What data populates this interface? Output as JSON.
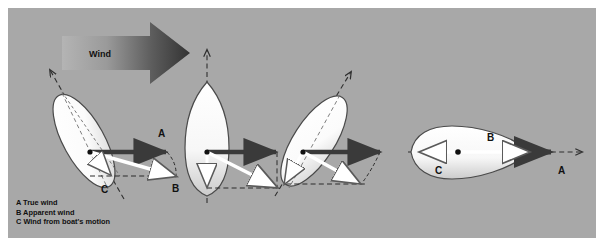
{
  "figure": {
    "background_color": "#a8a8a8",
    "page_color": "#ffffff",
    "panel": {
      "x": 8,
      "y": 8,
      "width": 588,
      "height": 230
    }
  },
  "wind": {
    "label": "Wind",
    "direction": "left-to-right",
    "arrow_gradient_from": "#b9b9b9",
    "arrow_gradient_to": "#3c3c3c",
    "label_x": 100,
    "label_y": 62
  },
  "legend": {
    "items": [
      {
        "key": "A",
        "text": "A True wind"
      },
      {
        "key": "B",
        "text": "B Apparent wind"
      },
      {
        "key": "C",
        "text": "C Wind from boat's motion"
      }
    ],
    "x": 16,
    "y_start": 203,
    "line_height": 9.5
  },
  "vectors": {
    "true_wind": {
      "key": "A",
      "name": "True wind",
      "color": "#3a3a3a",
      "style": "solid-dark-arrow"
    },
    "apparent_wind": {
      "key": "B",
      "name": "Apparent wind",
      "color": "#ffffff",
      "style": "solid-white-arrow"
    },
    "boat_motion_wind": {
      "key": "C",
      "name": "Wind from boat's motion",
      "color": "#ffffff",
      "style": "solid-white-arrow"
    }
  },
  "boats": [
    {
      "id": "boat-1",
      "point_of_sail": "close-hauled",
      "heading_label": "up-left",
      "origin": {
        "x": 90,
        "y": 152
      },
      "hull": {
        "cx": 83,
        "cy": 140,
        "rx": 20,
        "ry": 52,
        "rotate": -28
      },
      "course_line": {
        "x1": 122,
        "y1": 196,
        "x2": 48,
        "y2": 68
      },
      "course_arrow_tip": {
        "x": 48,
        "y": 68
      },
      "labels": [
        {
          "key": "A",
          "x": 158,
          "y": 133
        },
        {
          "key": "B",
          "x": 174,
          "y": 189
        },
        {
          "key": "C",
          "x": 104,
          "y": 190
        }
      ],
      "A_end": {
        "x": 167,
        "y": 152
      },
      "B_end": {
        "x": 176,
        "y": 176
      },
      "C_end": {
        "x": 112,
        "y": 175
      }
    },
    {
      "id": "boat-2",
      "point_of_sail": "beam-reach",
      "heading_label": "straight-up",
      "origin": {
        "x": 207,
        "y": 152
      },
      "hull": {
        "cx": 207,
        "cy": 137,
        "rx": 22,
        "ry": 55,
        "rotate": 0
      },
      "course_line": {
        "x1": 207,
        "y1": 200,
        "x2": 207,
        "y2": 48
      },
      "course_arrow_tip": {
        "x": 207,
        "y": 48
      },
      "labels": [],
      "A_end": {
        "x": 277,
        "y": 152
      },
      "B_end": {
        "x": 277,
        "y": 188
      },
      "C_end": {
        "x": 207,
        "y": 188
      }
    },
    {
      "id": "boat-3",
      "point_of_sail": "broad-reach",
      "heading_label": "up-right",
      "origin": {
        "x": 303,
        "y": 152
      },
      "hull": {
        "cx": 313,
        "cy": 140,
        "rx": 20,
        "ry": 52,
        "rotate": 33
      },
      "course_line": {
        "x1": 277,
        "y1": 193,
        "x2": 349,
        "y2": 70
      },
      "course_arrow_tip": {
        "x": 349,
        "y": 70
      },
      "labels": [],
      "A_end": {
        "x": 381,
        "y": 152
      },
      "B_end": {
        "x": 360,
        "y": 184
      },
      "C_end": {
        "x": 283,
        "y": 184
      }
    },
    {
      "id": "boat-4",
      "point_of_sail": "running",
      "heading_label": "right",
      "origin": {
        "x": 458,
        "y": 152
      },
      "hull": {
        "cx": 472,
        "cy": 152,
        "rx": 58,
        "ry": 22,
        "rotate": 0
      },
      "course_line": {
        "x1": 410,
        "y1": 152,
        "x2": 580,
        "y2": 152
      },
      "course_arrow_tip": {
        "x": 580,
        "y": 152
      },
      "labels": [
        {
          "key": "A",
          "x": 562,
          "y": 170
        },
        {
          "key": "B",
          "x": 490,
          "y": 140
        },
        {
          "key": "C",
          "x": 439,
          "y": 171
        }
      ],
      "A_end": {
        "x": 545,
        "y": 152
      },
      "B_end": {
        "x": 522,
        "y": 152
      },
      "C_end": {
        "x": 417,
        "y": 152
      }
    }
  ]
}
